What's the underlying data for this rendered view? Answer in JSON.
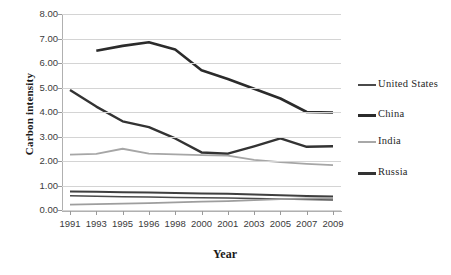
{
  "chart_data": {
    "type": "line",
    "title": "",
    "xlabel": "Year",
    "ylabel": "Carbon intensity",
    "x": [
      1991,
      1993,
      1995,
      1996,
      1998,
      2000,
      2001,
      2003,
      2005,
      2007,
      2009
    ],
    "xtick_labels": [
      "1991",
      "1993",
      "1995",
      "1996",
      "1998",
      "2000",
      "2001",
      "2003",
      "2005",
      "2007",
      "2009"
    ],
    "ytick_labels": [
      "0.00",
      "1.00",
      "2.00",
      "3.00",
      "4.00",
      "5.00",
      "6.00",
      "7.00",
      "8.00"
    ],
    "ylim": [
      0,
      8
    ],
    "ytick_step": 1.0,
    "grid": "horizontal",
    "legend_position": "right",
    "series": [
      {
        "name": "United States",
        "color": "#4a4a4a",
        "width": 1.6,
        "values": [
          0.58,
          0.56,
          0.54,
          0.53,
          0.51,
          0.5,
          0.49,
          0.47,
          0.45,
          0.43,
          0.41
        ]
      },
      {
        "name": "China",
        "color": "#2b2b2b",
        "width": 2.6,
        "values": [
          null,
          6.5,
          6.7,
          6.85,
          6.55,
          5.7,
          5.35,
          4.95,
          4.55,
          4.0,
          3.98
        ]
      },
      {
        "name": "India",
        "color": "#a6a6a6",
        "width": 1.8,
        "values": [
          2.26,
          2.29,
          2.5,
          2.3,
          2.27,
          2.24,
          2.22,
          2.05,
          1.95,
          1.88,
          1.83
        ]
      },
      {
        "name": "Russia",
        "color": "#333333",
        "width": 2.4,
        "values": [
          4.9,
          4.22,
          3.62,
          3.38,
          2.92,
          2.35,
          2.3,
          2.6,
          2.92,
          2.58,
          2.6
        ]
      },
      {
        "name": "bottom-band-upper",
        "color": "#3f3f3f",
        "width": 2.0,
        "values": [
          0.76,
          0.74,
          0.72,
          0.71,
          0.69,
          0.67,
          0.66,
          0.63,
          0.6,
          0.57,
          0.55
        ],
        "legend": false
      },
      {
        "name": "bottom-band-lower",
        "color": "#9e9e9e",
        "width": 1.8,
        "values": [
          0.22,
          0.24,
          0.26,
          0.28,
          0.31,
          0.34,
          0.36,
          0.4,
          0.44,
          0.47,
          0.49
        ],
        "legend": false
      }
    ],
    "legend_entries": [
      {
        "label": "United States",
        "color": "#4a4a4a",
        "width": 2
      },
      {
        "label": "China",
        "color": "#2b2b2b",
        "width": 3
      },
      {
        "label": "India",
        "color": "#a8a8a8",
        "width": 2
      },
      {
        "label": "Russia",
        "color": "#333333",
        "width": 3
      }
    ]
  }
}
